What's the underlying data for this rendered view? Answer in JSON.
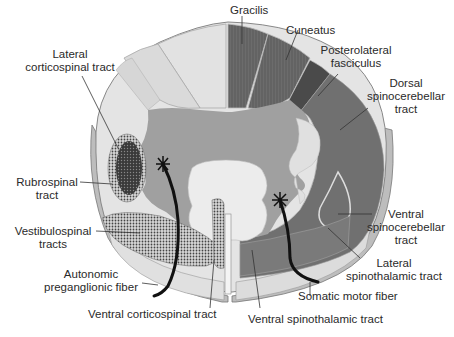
{
  "figure": {
    "colors": {
      "background": "#ffffff",
      "white_matter_light": "#d4d4d4",
      "white_matter_outer": "#e6e6e6",
      "ascending_dark": "#6a6a6a",
      "grey_matter": "#9c9c9c",
      "central_light": "#ececec",
      "descending_dots": "#4a4a4a",
      "lines": "#222222"
    },
    "labels": {
      "gracilis": "Gracilis",
      "cuneatus": "Cuneatus",
      "posterolateral_1": "Posterolateral",
      "posterolateral_2": "fasciculus",
      "dorsal_sc_1": "Dorsal",
      "dorsal_sc_2": "spinocerebellar",
      "dorsal_sc_3": "tract",
      "lateral_cs_1": "Lateral",
      "lateral_cs_2": "corticospinal tract",
      "rubrospinal_1": "Rubrospinal",
      "rubrospinal_2": "tract",
      "vestibulospinal_1": "Vestibulospinal",
      "vestibulospinal_2": "tracts",
      "autonomic_1": "Autonomic",
      "autonomic_2": "preganglionic fiber",
      "ventral_cs": "Ventral corticospinal tract",
      "ventral_sc_1": "Ventral",
      "ventral_sc_2": "spinocerebellar",
      "ventral_sc_3": "tract",
      "lateral_st_1": "Lateral",
      "lateral_st_2": "spinothalamic tract",
      "somatic_motor": "Somatic motor fiber",
      "ventral_st": "Ventral spinothalamic tract"
    }
  }
}
